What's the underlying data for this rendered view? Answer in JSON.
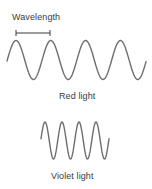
{
  "diagram": {
    "wavelength_label": "Wavelength",
    "red_wave": {
      "label": "Red light",
      "color": "#6e6e6e",
      "x_start": 7,
      "x_end": 146,
      "midline_y": 60,
      "amplitude": 19.5,
      "period": 34.8,
      "first_peak_x": 16
    },
    "violet_wave": {
      "label": "Violet light",
      "color": "#6e6e6e",
      "x_start": 41,
      "x_end": 109,
      "midline_y": 140.5,
      "amplitude": 18.5,
      "period": 17,
      "first_peak_x": 45
    },
    "wavelength_marker": {
      "y": 33,
      "x_start": 16,
      "x_end": 50,
      "tick_half_height": 3
    }
  }
}
